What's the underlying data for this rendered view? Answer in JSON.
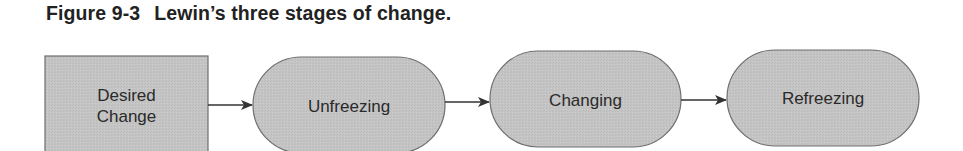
{
  "figure": {
    "number": "Figure 9-3",
    "caption": "Lewin’s three stages of change."
  },
  "colors": {
    "fill": "#c4c4c4",
    "stroke": "#6e6e6e",
    "text": "#2a2a2a",
    "arrow": "#333333"
  },
  "nodes": [
    {
      "id": "desired-change",
      "shape": "rectangle",
      "line1": "Desired",
      "line2": "Change"
    },
    {
      "id": "unfreezing",
      "shape": "pill",
      "label": "Unfreezing"
    },
    {
      "id": "changing",
      "shape": "pill",
      "label": "Changing"
    },
    {
      "id": "refreezing",
      "shape": "pill",
      "label": "Refreezing"
    }
  ],
  "edges": [
    {
      "from": "desired-change",
      "to": "unfreezing"
    },
    {
      "from": "unfreezing",
      "to": "changing"
    },
    {
      "from": "changing",
      "to": "refreezing"
    }
  ]
}
